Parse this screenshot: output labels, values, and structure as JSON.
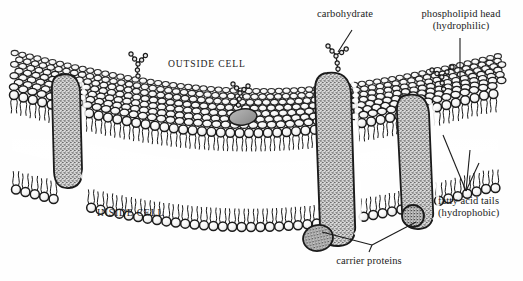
{
  "figure": {
    "background_color": "#fefefe",
    "ink_color": "#1b1b1b",
    "protein_fill_color": "#8a8a8a",
    "head_fill_color": "#f2f2f2",
    "core_highlight_color": "#ffffff"
  },
  "labels": {
    "carbohydrate": "carbohydrate",
    "phospholipid_head_line1": "phospholipid head",
    "phospholipid_head_line2": "(hydrophilic)",
    "outside_cell": "OUTSIDE CELL",
    "inside_cell": "INSIDE CELL",
    "fatty_acid_line1": "fatty acid tails",
    "fatty_acid_line2": "(hydrophobic)",
    "carrier_proteins": "carrier proteins"
  },
  "structures": {
    "bilayer": {
      "name": "phospholipid bilayer",
      "leaflets": [
        "outer leaflet",
        "inner leaflet"
      ],
      "head_shape": "circle",
      "tail_shape": "paired wavy lines"
    },
    "proteins": [
      {
        "name": "carrier-protein-left",
        "type": "transmembrane",
        "fill": "stippled"
      },
      {
        "name": "carrier-protein-center",
        "type": "transmembrane",
        "fill": "stippled"
      },
      {
        "name": "carrier-protein-right",
        "type": "transmembrane",
        "fill": "stippled"
      },
      {
        "name": "peripheral-protein-inner-left",
        "type": "peripheral",
        "fill": "stippled"
      },
      {
        "name": "peripheral-protein-inner-right",
        "type": "peripheral",
        "fill": "stippled"
      },
      {
        "name": "embedded-protein-outer",
        "type": "integral partial",
        "fill": "shaded"
      }
    ],
    "carbohydrates": [
      {
        "name": "glycolipid-chain-left",
        "branches": 2
      },
      {
        "name": "glycolipid-chain-mid",
        "branches": 2
      },
      {
        "name": "glycoprotein-chain-center",
        "branches": 2
      },
      {
        "name": "glycoprotein-chain-right",
        "branches": 2
      }
    ]
  }
}
